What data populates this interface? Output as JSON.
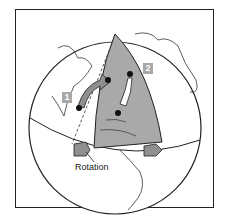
{
  "diagram": {
    "labels": {
      "marker_1": "1",
      "marker_2": "2",
      "rotation": "Rotation"
    },
    "colors": {
      "wedge": "#a9a9a9",
      "outline": "#222222",
      "label_bg": "#a8a8a8",
      "background": "#ffffff"
    },
    "elements": [
      "globe",
      "equator",
      "meridian-wedge",
      "curved-arrow-1",
      "curved-arrow-2",
      "rotation-arrow-left",
      "rotation-arrow-right",
      "continent-outlines",
      "dashed-guide-lines",
      "dot-points"
    ]
  }
}
